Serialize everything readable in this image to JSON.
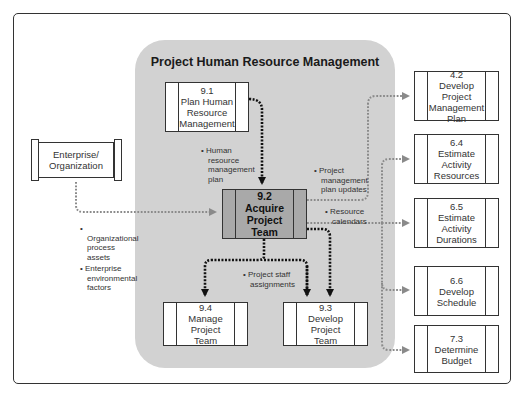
{
  "diagram": {
    "region_title": "Project Human Resource Management",
    "colors": {
      "region_fill": "#d2d2d2",
      "focus_fill": "#a9a9a9",
      "black_arrow": "#111111",
      "gray_arrow": "#8a8a8a",
      "border": "#333333"
    },
    "processes": {
      "p91": {
        "number": "9.1",
        "label": "Plan Human Resource Management"
      },
      "p92": {
        "number": "9.2",
        "label": "Acquire Project Team"
      },
      "p93": {
        "number": "9.3",
        "label": "Develop Project Team"
      },
      "p94": {
        "number": "9.4",
        "label": "Manage Project Team"
      }
    },
    "external": {
      "enterprise": {
        "label": "Enterprise/ Organization"
      },
      "p42": {
        "number": "4.2",
        "label": "Develop Project Management Plan"
      },
      "p64": {
        "number": "6.4",
        "label": "Estimate Activity Resources"
      },
      "p65": {
        "number": "6.5",
        "label": "Estimate Activity Durations"
      },
      "p66": {
        "number": "6.6",
        "label": "Develop Schedule"
      },
      "p73": {
        "number": "7.3",
        "label": "Determine Budget"
      }
    },
    "flows": {
      "hr_plan": [
        "• Human resource management plan"
      ],
      "pm_updates": [
        "• Project management plan updates"
      ],
      "res_calendars": [
        "• Resource calendars"
      ],
      "staff_assign": [
        "• Project staff assignments"
      ],
      "enterprise_inputs": [
        "• Organizational process assets",
        "• Enterprise environmental factors"
      ]
    }
  }
}
